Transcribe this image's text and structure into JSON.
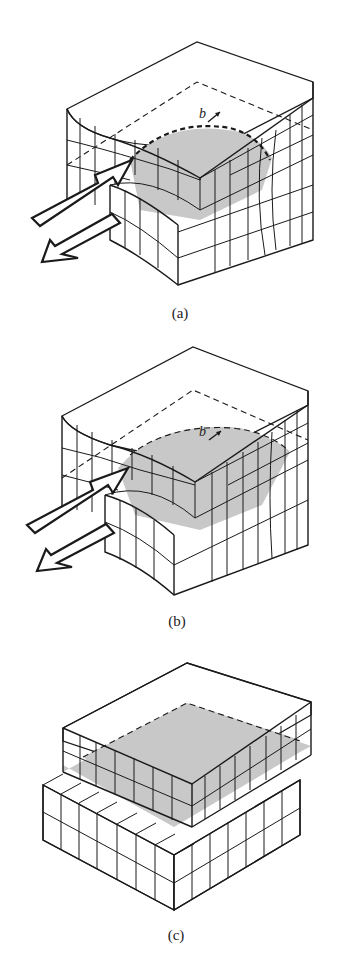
{
  "figure": {
    "panels": [
      {
        "id": "a",
        "caption": "(a)",
        "burgers_label": "b",
        "description": "Crystal block with partial slip region (shaded) and curved dislocation line; shear arrows applied on front-left face"
      },
      {
        "id": "b",
        "caption": "(b)",
        "burgers_label": "b",
        "description": "Dislocation line advanced further; larger shaded slipped area"
      },
      {
        "id": "c",
        "caption": "(c)",
        "burgers_label": "",
        "description": "Slip complete across entire plane; upper block offset by one lattice spacing"
      }
    ],
    "colors": {
      "line": "#1a1a1a",
      "slip_plane_fill": "#c8c8c8",
      "background": "#ffffff"
    }
  }
}
